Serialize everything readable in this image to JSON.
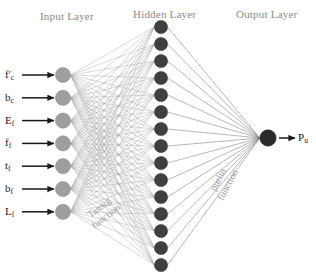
{
  "diagram": {
    "background_color": "#ffffff",
    "width": 316,
    "height": 278
  },
  "layers": {
    "input": {
      "title": "Input Layer",
      "title_color": "#8a8a8a",
      "node_count": 7,
      "node_color": "#9e9e9e",
      "node_stroke": "#8c8c8c",
      "node_radius": 7.6,
      "center_x": 63,
      "first_y": 75,
      "spacing_y": 22.8,
      "labels": [
        {
          "base": "f",
          "prime": true,
          "sub": "c"
        },
        {
          "base": "b",
          "prime": false,
          "sub": "c"
        },
        {
          "base": "E",
          "prime": false,
          "sub": "f"
        },
        {
          "base": "f",
          "prime": false,
          "sub": "f"
        },
        {
          "base": "t",
          "prime": false,
          "sub": "f"
        },
        {
          "base": "b",
          "prime": false,
          "sub": "f"
        },
        {
          "base": "L",
          "prime": false,
          "sub": "f"
        }
      ]
    },
    "hidden": {
      "title": "Hidden Layer",
      "title_color": "#8a8a8a",
      "node_count": 15,
      "node_color": "#3f3f3f",
      "node_stroke": "#333333",
      "node_radius": 6.6,
      "center_x": 161,
      "first_y": 27,
      "spacing_y": 17.0
    },
    "output": {
      "title": "Output Layer",
      "title_color": "#8a8a8a",
      "node_count": 1,
      "node_color": "#2b2b2b",
      "node_stroke": "#222222",
      "node_radius": 8.2,
      "center_x": 268,
      "center_y": 138,
      "label": {
        "base": "P",
        "sub": "u"
      }
    }
  },
  "connections": {
    "input_to_hidden_color": "#a8a8a8",
    "hidden_to_output_color": "#7d7d7d",
    "stroke_width": 0.45
  },
  "arrows": {
    "color": "#1a1a1a",
    "input_arrow_start_x": 22,
    "input_arrow_end_x": 54,
    "output_arrow_start_x": 279,
    "output_arrow_end_x": 295
  },
  "annotations": [
    {
      "name": "tansig-function",
      "line1": "Tansig",
      "line2": "function",
      "color": "#9a9a9a"
    },
    {
      "name": "purlin-function",
      "line1": "purlin",
      "line2": "function",
      "color": "#9a9a9a"
    }
  ],
  "titles": {
    "input_layer": "Input Layer",
    "hidden_layer": "Hidden Layer",
    "output_layer": "Output Layer"
  }
}
